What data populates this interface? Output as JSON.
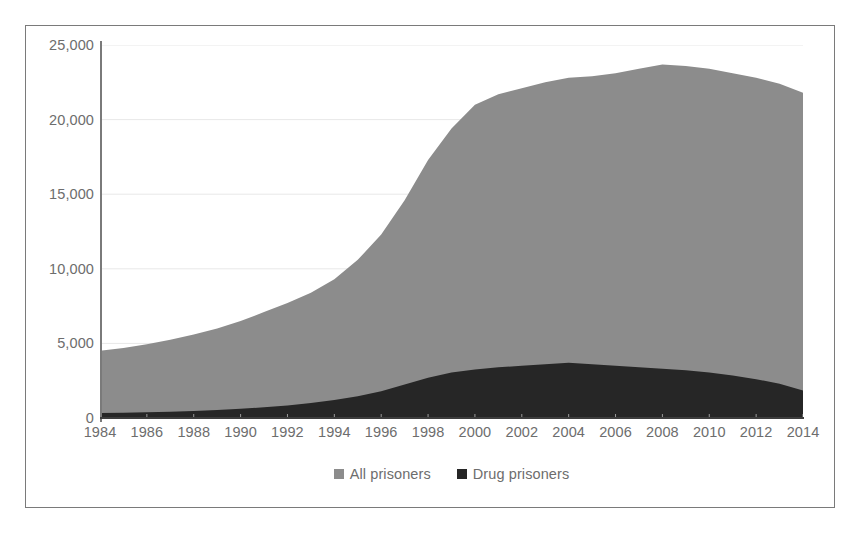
{
  "chart_data": {
    "type": "area",
    "title": "",
    "subtitle": "",
    "xlabel": "",
    "ylabel": "",
    "stacked": false,
    "grid": true,
    "gridlines": "horizontal",
    "legend_position": "bottom",
    "xlim": [
      1984,
      2014
    ],
    "ylim": [
      0,
      25000
    ],
    "ytick_labels": [
      "0",
      "5,000",
      "10,000",
      "15,000",
      "20,000",
      "25,000"
    ],
    "yticks": [
      0,
      5000,
      10000,
      15000,
      20000,
      25000
    ],
    "xtick_labels": [
      "1984",
      "1986",
      "1988",
      "1990",
      "1992",
      "1994",
      "1996",
      "1998",
      "2000",
      "2002",
      "2004",
      "2006",
      "2008",
      "2010",
      "2012",
      "2014"
    ],
    "xticks": [
      1984,
      1986,
      1988,
      1990,
      1992,
      1994,
      1996,
      1998,
      2000,
      2002,
      2004,
      2006,
      2008,
      2010,
      2012,
      2014
    ],
    "x": [
      1984,
      1985,
      1986,
      1987,
      1988,
      1989,
      1990,
      1991,
      1992,
      1993,
      1994,
      1995,
      1996,
      1997,
      1998,
      1999,
      2000,
      2001,
      2002,
      2003,
      2004,
      2005,
      2006,
      2007,
      2008,
      2009,
      2010,
      2011,
      2012,
      2013,
      2014
    ],
    "series": [
      {
        "name": "All prisoners",
        "color": "#8c8c8c",
        "values": [
          4500,
          4700,
          4950,
          5250,
          5600,
          6000,
          6500,
          7100,
          7700,
          8400,
          9300,
          10600,
          12300,
          14600,
          17300,
          19400,
          21000,
          21700,
          22100,
          22500,
          22800,
          22900,
          23100,
          23400,
          23700,
          23600,
          23400,
          23100,
          22800,
          22400,
          21800
        ]
      },
      {
        "name": "Drug prisoners",
        "color": "#262626",
        "values": [
          330,
          350,
          380,
          420,
          470,
          540,
          620,
          720,
          840,
          1000,
          1200,
          1450,
          1800,
          2250,
          2700,
          3050,
          3250,
          3400,
          3500,
          3600,
          3700,
          3600,
          3500,
          3400,
          3300,
          3200,
          3050,
          2850,
          2600,
          2300,
          1850
        ]
      }
    ]
  },
  "legend": {
    "items": [
      {
        "label": "All prisoners",
        "color": "#8c8c8c",
        "swatch_name": "legend-swatch-all-prisoners"
      },
      {
        "label": "Drug prisoners",
        "color": "#262626",
        "swatch_name": "legend-swatch-drug-prisoners"
      }
    ]
  }
}
